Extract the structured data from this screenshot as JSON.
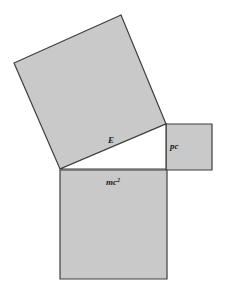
{
  "diagram": {
    "colors": {
      "fill": "#c9c9c9",
      "stroke": "#3f3f3f",
      "triangle_fill": "#ffffff",
      "label": "#222222",
      "background": "#ffffff"
    },
    "triangle": {
      "points": "60,169 166,124 166,169"
    },
    "squares": {
      "hypotenuse": {
        "label": "E",
        "points": "60,169 166,124 121,15 14,63",
        "label_pos": {
          "x": 108,
          "y": 143
        }
      },
      "vertical_leg": {
        "label": "pc",
        "points": "166,124 212,124 212,170 166,170",
        "label_pos": {
          "x": 170,
          "y": 149
        }
      },
      "horizontal_leg": {
        "label_base": "mc",
        "label_sup": "2",
        "points": "60,170 167,170 167,279 60,279",
        "label_pos": {
          "x": 106,
          "y": 185
        }
      }
    }
  }
}
